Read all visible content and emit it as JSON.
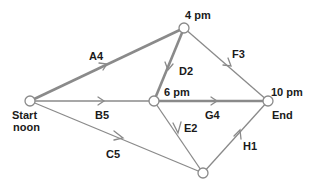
{
  "diagram": {
    "type": "activity-network",
    "nodes": [
      {
        "id": "start",
        "x": 30,
        "y": 101,
        "labels": [
          "Start",
          "noon"
        ]
      },
      {
        "id": "n4pm",
        "x": 184,
        "y": 28,
        "labels": [
          "4 pm"
        ]
      },
      {
        "id": "n6pm",
        "x": 154,
        "y": 101,
        "labels": [
          "6 pm"
        ]
      },
      {
        "id": "end",
        "x": 268,
        "y": 101,
        "labels": [
          "10 pm",
          "End"
        ]
      },
      {
        "id": "bottom",
        "x": 203,
        "y": 173,
        "labels": []
      }
    ],
    "edges": [
      {
        "label": "A4",
        "from": "start",
        "to": "n4pm",
        "critical": true
      },
      {
        "label": "B5",
        "from": "start",
        "to": "n6pm",
        "critical": false
      },
      {
        "label": "C5",
        "from": "start",
        "to": "bottom",
        "critical": false
      },
      {
        "label": "D2",
        "from": "n4pm",
        "to": "n6pm",
        "critical": true
      },
      {
        "label": "F3",
        "from": "n4pm",
        "to": "end",
        "critical": false
      },
      {
        "label": "G4",
        "from": "n6pm",
        "to": "end",
        "critical": true
      },
      {
        "label": "E2",
        "from": "n6pm",
        "to": "bottom",
        "critical": false
      },
      {
        "label": "H1",
        "from": "bottom",
        "to": "end",
        "critical": false
      }
    ],
    "labels": {
      "start_line1": "Start",
      "start_line2": "noon",
      "n4pm": "4 pm",
      "n6pm": "6 pm",
      "end_time": "10 pm",
      "end": "End",
      "A4": "A4",
      "B5": "B5",
      "C5": "C5",
      "D2": "D2",
      "E2": "E2",
      "F3": "F3",
      "G4": "G4",
      "H1": "H1"
    },
    "colors": {
      "edge": "#8a8a8a",
      "node_fill": "#ffffff",
      "text": "#1a1a1a"
    }
  }
}
